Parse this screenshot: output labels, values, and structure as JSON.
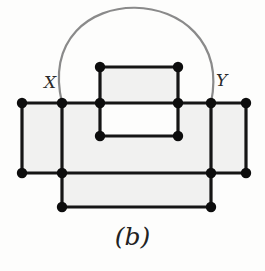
{
  "figure": {
    "caption": "(b)",
    "background_color": "#fdfdfc",
    "width": 265,
    "height": 271
  },
  "labels": {
    "x": "X",
    "y": "Y"
  },
  "style": {
    "edge_color": "#151515",
    "edge_width": 3.2,
    "vertex_color": "#0d0d0d",
    "vertex_radius": 5.2,
    "face_fill": "#f1f1f0",
    "face_stroke": "none",
    "arc_color": "#8a8a8a",
    "arc_width": 2.2,
    "label_color": "#2b2b2b"
  },
  "chart_data": {
    "type": "diagram",
    "subtype": "planar-graph",
    "title": "(b)",
    "vertices": [
      {
        "id": "v1",
        "label": "",
        "x": 22,
        "y": 103
      },
      {
        "id": "v2",
        "label": "X",
        "x": 62,
        "y": 103
      },
      {
        "id": "v3",
        "label": "",
        "x": 100,
        "y": 103
      },
      {
        "id": "v4",
        "label": "",
        "x": 178,
        "y": 103
      },
      {
        "id": "v5",
        "label": "Y",
        "x": 211,
        "y": 103
      },
      {
        "id": "v6",
        "label": "",
        "x": 246,
        "y": 103
      },
      {
        "id": "v7",
        "label": "",
        "x": 100,
        "y": 67
      },
      {
        "id": "v8",
        "label": "",
        "x": 178,
        "y": 67
      },
      {
        "id": "v9",
        "label": "",
        "x": 100,
        "y": 136
      },
      {
        "id": "v10",
        "label": "",
        "x": 178,
        "y": 136
      },
      {
        "id": "v11",
        "label": "",
        "x": 22,
        "y": 173
      },
      {
        "id": "v12",
        "label": "",
        "x": 62,
        "y": 173
      },
      {
        "id": "v13",
        "label": "",
        "x": 211,
        "y": 173
      },
      {
        "id": "v14",
        "label": "",
        "x": 246,
        "y": 173
      },
      {
        "id": "v15",
        "label": "",
        "x": 62,
        "y": 207
      },
      {
        "id": "v16",
        "label": "",
        "x": 211,
        "y": 207
      }
    ],
    "edges": [
      {
        "from": "v1",
        "to": "v2",
        "kind": "straight"
      },
      {
        "from": "v2",
        "to": "v3",
        "kind": "straight"
      },
      {
        "from": "v3",
        "to": "v4",
        "kind": "straight"
      },
      {
        "from": "v4",
        "to": "v5",
        "kind": "straight"
      },
      {
        "from": "v5",
        "to": "v6",
        "kind": "straight"
      },
      {
        "from": "v7",
        "to": "v8",
        "kind": "straight"
      },
      {
        "from": "v7",
        "to": "v3",
        "kind": "straight"
      },
      {
        "from": "v8",
        "to": "v4",
        "kind": "straight"
      },
      {
        "from": "v3",
        "to": "v9",
        "kind": "straight"
      },
      {
        "from": "v4",
        "to": "v10",
        "kind": "straight"
      },
      {
        "from": "v9",
        "to": "v10",
        "kind": "straight"
      },
      {
        "from": "v1",
        "to": "v11",
        "kind": "straight"
      },
      {
        "from": "v2",
        "to": "v12",
        "kind": "straight"
      },
      {
        "from": "v5",
        "to": "v13",
        "kind": "straight"
      },
      {
        "from": "v6",
        "to": "v14",
        "kind": "straight"
      },
      {
        "from": "v11",
        "to": "v12",
        "kind": "straight"
      },
      {
        "from": "v12",
        "to": "v13",
        "kind": "straight"
      },
      {
        "from": "v13",
        "to": "v14",
        "kind": "straight"
      },
      {
        "from": "v12",
        "to": "v15",
        "kind": "straight"
      },
      {
        "from": "v13",
        "to": "v16",
        "kind": "straight"
      },
      {
        "from": "v15",
        "to": "v16",
        "kind": "straight"
      },
      {
        "from": "v2",
        "to": "v5",
        "kind": "arc",
        "color": "#8a8a8a",
        "peak_y": 14
      }
    ],
    "faces": [
      {
        "name": "left-square",
        "points": "22,103 62,103 62,173 22,173"
      },
      {
        "name": "center-upper",
        "points": "62,103 100,103 100,136 178,136 178,103 211,103 211,173 62,173"
      },
      {
        "name": "inner-top",
        "points": "100,67 178,67 178,103 100,103"
      },
      {
        "name": "right-square",
        "points": "211,103 246,103 246,173 211,173"
      },
      {
        "name": "bottom-strip",
        "points": "62,173 211,173 211,207 62,207"
      }
    ]
  }
}
